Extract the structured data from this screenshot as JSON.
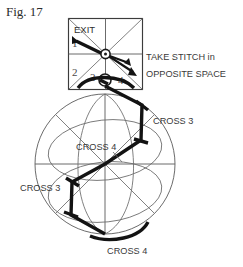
{
  "figure": {
    "caption": "Fig. 17",
    "kind": "needlework-stitch-diagram"
  },
  "square_panel": {
    "name": "upper-square-panel",
    "exit_label": "EXIT",
    "corner_numbers": [
      "1",
      "2",
      "3",
      "4"
    ],
    "number_1": "1",
    "number_2": "2",
    "number_3": "3",
    "number_4": "4"
  },
  "annotations": {
    "take_stitch_line1": "TAKE STITCH in",
    "take_stitch_line2": "OPPOSITE SPACE",
    "cross_3_upper_right": "CROSS 3",
    "cross_4_center": "CROSS 4",
    "cross_3_lower_left": "CROSS 3",
    "cross_4_bottom": "CROSS 4"
  },
  "colors": {
    "background": "#ffffff",
    "thread": "#131313",
    "grid": "#5a5a5a",
    "text": "#2f2f2f",
    "caption": "#2b2b2b"
  }
}
